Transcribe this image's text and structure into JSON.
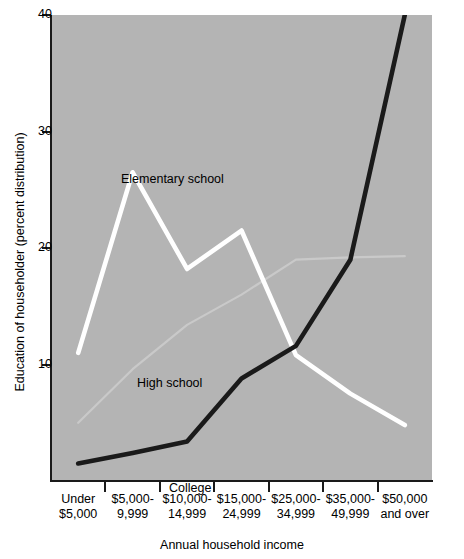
{
  "chart_data": {
    "type": "line",
    "title": "",
    "xlabel": "Annual household income",
    "ylabel": "Education of householder (percent distribution)",
    "ylim": [
      0,
      40
    ],
    "yticks": [
      10,
      20,
      30,
      40
    ],
    "grid": false,
    "legend_position": "inline-labels",
    "categories": [
      "Under $5,000",
      "$5,000-9,999",
      "$10,000-14,999",
      "$15,000-24,999",
      "$25,000-34,999",
      "$35,000-49,999",
      "$50,000 and over"
    ],
    "series": [
      {
        "name": "Elementary school",
        "color": "#ffffff",
        "values": [
          11.0,
          26.5,
          18.2,
          21.5,
          10.8,
          7.5,
          4.8
        ]
      },
      {
        "name": "High school",
        "color": "#c9c9c9",
        "values": [
          5.0,
          9.6,
          13.4,
          16.0,
          19.0,
          19.2,
          19.3
        ]
      },
      {
        "name": "College",
        "color": "#1a1a1a",
        "values": [
          1.5,
          2.4,
          3.4,
          8.8,
          11.6,
          19.0,
          40.0
        ]
      }
    ]
  },
  "axes": {
    "y_tick_labels": [
      "40",
      "30",
      "20",
      "10"
    ],
    "y_title": "Education of householder (percent distribution)",
    "x_title": "Annual household income",
    "x_tick_labels": [
      {
        "line1": "Under",
        "line2": "$5,000"
      },
      {
        "line1": "$5,000-",
        "line2": "9,999"
      },
      {
        "line1": "$10,000-",
        "line2": "14,999"
      },
      {
        "line1": "$15,000-",
        "line2": "24,999"
      },
      {
        "line1": "$25,000-",
        "line2": "34,999"
      },
      {
        "line1": "$35,000-",
        "line2": "49,999"
      },
      {
        "line1": "$50,000",
        "line2": "and over"
      }
    ]
  },
  "series_labels": {
    "elementary": "Elementary school",
    "high_school": "High school",
    "college": "College"
  },
  "colors": {
    "plot_background": "#b4b4b4",
    "page_background": "#ffffff",
    "axis": "#1a1a1a",
    "elementary_line": "#ffffff",
    "high_school_line": "#c9c9c9",
    "college_line": "#1a1a1a"
  }
}
